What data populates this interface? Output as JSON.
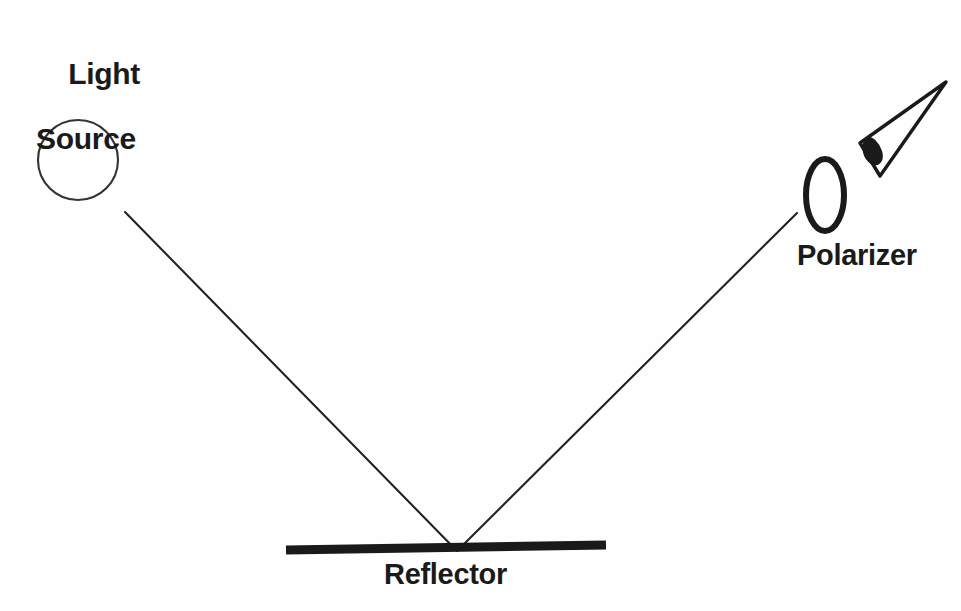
{
  "figure": {
    "background_color": "#fefefe",
    "stroke_color": "#1a1a1a",
    "width": 961,
    "height": 611
  },
  "labels": {
    "light_source_line1": "Light",
    "light_source_line2": "Source",
    "polarizer": "Polarizer",
    "reflector": "Reflector"
  },
  "icons": {
    "light_source": "circle-icon",
    "polarizer": "ellipse-icon",
    "reflector": "bar-icon",
    "observer": "eye-icon",
    "incident_ray": "ray-line-icon",
    "reflected_ray": "ray-line-icon"
  },
  "geometry": {
    "light_source_circle": {
      "cx": 78,
      "cy": 160,
      "r": 40
    },
    "incident_ray": {
      "x1": 125,
      "y1": 212,
      "x2": 457,
      "y2": 551
    },
    "reflected_ray": {
      "x1": 457,
      "y1": 551,
      "x2": 797,
      "y2": 213
    },
    "reflector_bar": {
      "x1": 286,
      "y1": 549,
      "x2": 606,
      "y2": 545,
      "thickness": 9
    },
    "polarizer_ellipse": {
      "cx": 825,
      "cy": 195,
      "rx": 20,
      "ry": 36
    },
    "eye": {
      "apex_x": 946,
      "apex_y": 82,
      "pupil_x": 872,
      "pupil_y": 152
    }
  }
}
